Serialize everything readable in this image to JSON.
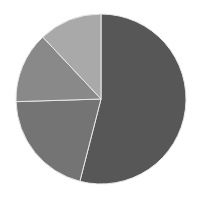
{
  "chart_data": {
    "type": "pie",
    "title": "",
    "legend": [],
    "labels": [
      "Slice 1",
      "Slice 2",
      "Slice 3",
      "Slice 4"
    ],
    "values": [
      54,
      20.5,
      13.5,
      12
    ],
    "colors": [
      "#575757",
      "#747474",
      "#898989",
      "#a9a9a9"
    ],
    "start_angle_deg": 0,
    "direction": "clockwise",
    "center": [
      101,
      99
    ],
    "radius": 85
  }
}
